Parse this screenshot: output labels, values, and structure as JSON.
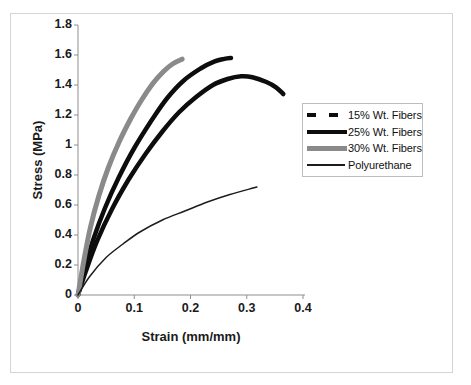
{
  "chart_data": {
    "type": "line",
    "title": "",
    "xlabel": "Strain (mm/mm)",
    "ylabel": "Stress (MPa)",
    "xlim": [
      0,
      0.4
    ],
    "ylim": [
      0,
      1.8
    ],
    "x_ticks": [
      "0",
      "0.1",
      "0.2",
      "0.3",
      "0.4"
    ],
    "y_ticks": [
      "0",
      "0.2",
      "0.4",
      "0.6",
      "0.8",
      "1",
      "1.2",
      "1.4",
      "1.6",
      "1.8"
    ],
    "grid": false,
    "legend_position": "right",
    "series": [
      {
        "name": "15% Wt. Fibers",
        "color": "#0d0d0d",
        "stroke_width": 4.5,
        "legend_swatch": "dashed-thick",
        "points": [
          [
            0,
            0
          ],
          [
            0.014,
            0.16
          ],
          [
            0.034,
            0.36
          ],
          [
            0.06,
            0.57
          ],
          [
            0.09,
            0.77
          ],
          [
            0.12,
            0.94
          ],
          [
            0.15,
            1.09
          ],
          [
            0.18,
            1.22
          ],
          [
            0.21,
            1.32
          ],
          [
            0.24,
            1.4
          ],
          [
            0.266,
            1.44
          ],
          [
            0.29,
            1.458
          ],
          [
            0.31,
            1.452
          ],
          [
            0.335,
            1.42
          ],
          [
            0.352,
            1.385
          ],
          [
            0.365,
            1.34
          ]
        ]
      },
      {
        "name": "25% Wt. Fibers",
        "color": "#0d0d0d",
        "stroke_width": 4.5,
        "legend_swatch": "solid-thick",
        "points": [
          [
            0,
            0
          ],
          [
            0.012,
            0.18
          ],
          [
            0.028,
            0.38
          ],
          [
            0.048,
            0.58
          ],
          [
            0.072,
            0.78
          ],
          [
            0.1,
            0.98
          ],
          [
            0.13,
            1.16
          ],
          [
            0.158,
            1.31
          ],
          [
            0.188,
            1.43
          ],
          [
            0.218,
            1.51
          ],
          [
            0.243,
            1.557
          ],
          [
            0.26,
            1.574
          ],
          [
            0.272,
            1.58
          ]
        ]
      },
      {
        "name": "30% Wt. Fibers",
        "color": "#8a8a8a",
        "stroke_width": 5,
        "legend_swatch": "solid-thick",
        "points": [
          [
            0,
            0
          ],
          [
            0.01,
            0.22
          ],
          [
            0.022,
            0.45
          ],
          [
            0.037,
            0.66
          ],
          [
            0.054,
            0.85
          ],
          [
            0.073,
            1.02
          ],
          [
            0.093,
            1.17
          ],
          [
            0.113,
            1.3
          ],
          [
            0.133,
            1.41
          ],
          [
            0.152,
            1.49
          ],
          [
            0.168,
            1.54
          ],
          [
            0.185,
            1.572
          ]
        ]
      },
      {
        "name": "Polyurethane",
        "color": "#1c1c1c",
        "stroke_width": 1.5,
        "legend_swatch": "thin",
        "points": [
          [
            0,
            0
          ],
          [
            0.02,
            0.12
          ],
          [
            0.05,
            0.25
          ],
          [
            0.08,
            0.34
          ],
          [
            0.11,
            0.42
          ],
          [
            0.15,
            0.5
          ],
          [
            0.19,
            0.56
          ],
          [
            0.23,
            0.62
          ],
          [
            0.27,
            0.67
          ],
          [
            0.318,
            0.72
          ]
        ]
      }
    ]
  },
  "colors": {
    "axis": "#8f8f8f",
    "frame_border": "#d4d4d4",
    "legend_border": "#bdbdbd",
    "text": "#1a1a1a",
    "background": "#ffffff"
  }
}
